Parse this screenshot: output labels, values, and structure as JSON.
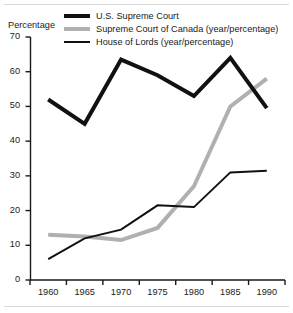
{
  "chart_data": {
    "type": "line",
    "title": "",
    "xlabel": "",
    "ylabel": "Percentage",
    "x": [
      1960,
      1965,
      1970,
      1975,
      1980,
      1985,
      1990
    ],
    "xtick_labels": [
      "1960",
      "1965",
      "1970",
      "1975",
      "1980",
      "1985",
      "1990"
    ],
    "xlim": [
      1957.5,
      1992.5
    ],
    "ylim": [
      0,
      70
    ],
    "ytick_labels": [
      "0",
      "10",
      "20",
      "30",
      "40",
      "50",
      "60",
      "70"
    ],
    "yticks": [
      0,
      10,
      20,
      30,
      40,
      50,
      60,
      70
    ],
    "grid": false,
    "legend_position": "top",
    "series": [
      {
        "name": "U.S. Supreme Court",
        "color": "#111111",
        "width": 4,
        "values": [
          52,
          45,
          63.5,
          59,
          53,
          64,
          49.5
        ]
      },
      {
        "name": "Supreme Court of Canada (year/percentage)",
        "color": "#b0b0b0",
        "width": 4,
        "values": [
          13,
          12.5,
          11.5,
          15,
          27,
          50,
          58
        ]
      },
      {
        "name": "House of Lords (year/percentage)",
        "color": "#111111",
        "width": 2,
        "values": [
          6,
          12,
          14.5,
          21.5,
          21,
          31,
          31.5
        ]
      }
    ]
  },
  "legend": {
    "items": [
      {
        "label": "U.S. Supreme Court",
        "swatch": "line-thick-black-swatch"
      },
      {
        "label": "Supreme Court of Canada (year/percentage)",
        "swatch": "line-gray-swatch"
      },
      {
        "label": "House of Lords (year/percentage)",
        "swatch": "line-thin-black-swatch"
      }
    ]
  },
  "axes": {
    "y_axis_title": "Percentage"
  }
}
